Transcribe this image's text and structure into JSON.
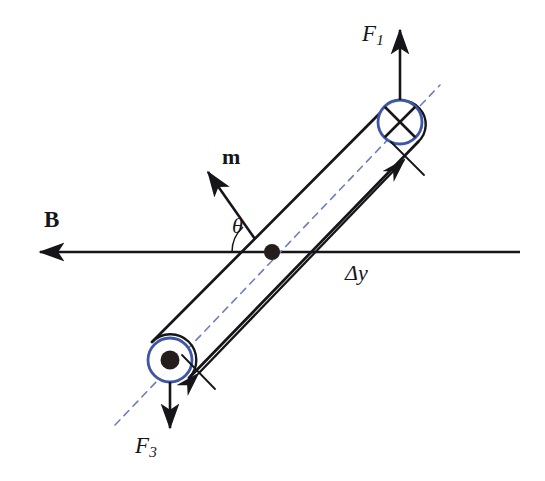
{
  "figure": {
    "background_color": "#ffffff"
  },
  "colors": {
    "stroke": "#15151a",
    "text": "#15151a",
    "loop_marker_blue": "#3f56a4",
    "axis_dashed_blue": "#6e7fb8"
  },
  "labels": {
    "force_top": {
      "symbol": "F",
      "subscript": "1",
      "text": "F1"
    },
    "force_bottom": {
      "symbol": "F",
      "subscript": "3",
      "text": "F3"
    },
    "magnetic_moment": {
      "text": "m"
    },
    "magnetic_field": {
      "text": "B"
    },
    "angle": {
      "text": "θ"
    },
    "separation": {
      "text": "Δy"
    }
  },
  "markers": {
    "current_into_page": {
      "name": "cross-in-circle",
      "glyph": "⊗",
      "position": "top-right",
      "center": [
        400,
        122
      ],
      "radius": 22
    },
    "current_out_of_page": {
      "name": "dot-in-circle",
      "glyph": "⊙",
      "position": "bottom-left",
      "center": [
        170,
        360
      ],
      "radius": 22
    },
    "pivot": {
      "name": "center-pivot-dot",
      "center": [
        272,
        252
      ],
      "radius": 7
    }
  },
  "geometry": {
    "field_line": {
      "from": [
        520,
        252
      ],
      "to": [
        33,
        252
      ],
      "arrow_at": "left"
    },
    "loop_axis_dashed": {
      "from": [
        115,
        425
      ],
      "to": [
        440,
        85
      ]
    },
    "loop_edge_upper": {
      "from": [
        155,
        345
      ],
      "to": [
        385,
        108
      ]
    },
    "loop_edge_lower": {
      "from": [
        188,
        377
      ],
      "to": [
        416,
        140
      ]
    },
    "moment_vector": {
      "from": [
        253,
        236
      ],
      "to": [
        205,
        168
      ],
      "arrow_at": "tip"
    },
    "force_top_vector": {
      "from": [
        400,
        100
      ],
      "to": [
        400,
        22
      ],
      "arrow_at": "top"
    },
    "force_bottom_vector": {
      "from": [
        170,
        382
      ],
      "to": [
        170,
        432
      ],
      "arrow_at": "bottom"
    },
    "dimension_line": {
      "from": [
        190,
        382
      ],
      "to": [
        410,
        153
      ],
      "arrows": "both"
    },
    "angle_arc": {
      "vertex": [
        258,
        243
      ],
      "label_side": "left"
    }
  }
}
